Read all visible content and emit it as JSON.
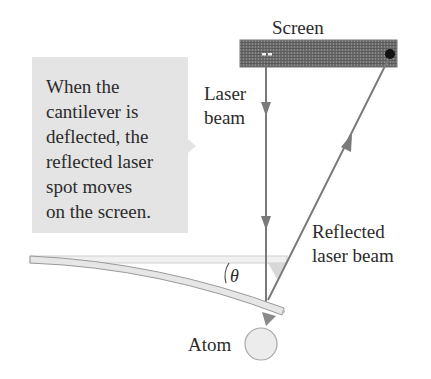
{
  "labels": {
    "screen": "Screen",
    "laser_beam": "Laser\nbeam",
    "reflected_laser_beam": "Reflected\nlaser beam",
    "angle": "θ",
    "atom": "Atom"
  },
  "callout": {
    "text": "When the\ncantilever is\ndeflected, the\nreflected laser\nspot moves\non the screen."
  },
  "colors": {
    "beam": "#7a7a7a",
    "screen": "#6e6e6e",
    "callout_bg": "#e4e4e4",
    "cantilever_fill": "#e6e6e6",
    "cantilever_edge": "#9a9a9a",
    "spot": "#111111",
    "tip": "#8a8a8a",
    "atom_fill": "#ececec"
  }
}
